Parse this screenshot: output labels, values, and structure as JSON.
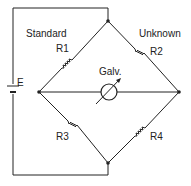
{
  "diagram": {
    "labels": {
      "standard": "Standard",
      "unknown": "Unknown",
      "r1": "R1",
      "r2": "R2",
      "r3": "R3",
      "r4": "R4",
      "galvanometer": "Galv.",
      "source": "E"
    },
    "colors": {
      "line": "#222222",
      "background": "#ffffff"
    }
  }
}
